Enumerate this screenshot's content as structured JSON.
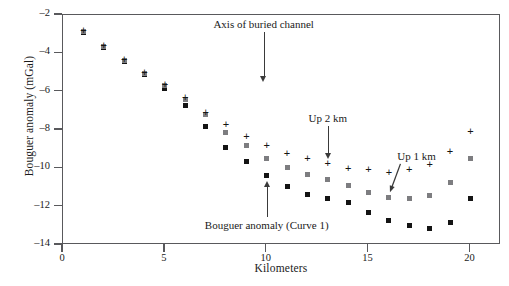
{
  "chart_data": {
    "type": "scatter",
    "title": "",
    "xlabel": "Kilometers",
    "ylabel": "Bouguer anomaly (mGal)",
    "xlim": [
      0,
      21.5
    ],
    "ylim": [
      -14,
      -2
    ],
    "xticks": [
      0,
      5,
      10,
      15,
      20
    ],
    "yticks": [
      -2,
      -4,
      -6,
      -8,
      -10,
      -12,
      -14
    ],
    "xtick_labels": [
      "0",
      "5",
      "10",
      "15",
      "20"
    ],
    "ytick_labels": [
      "-2",
      "-4",
      "-6",
      "-8",
      "-10",
      "-12",
      "-14"
    ],
    "grid": false,
    "legend": "none (inline annotations)",
    "x": [
      1,
      2,
      3,
      4,
      5,
      6,
      7,
      8,
      9,
      10,
      11,
      12,
      13,
      14,
      15,
      16,
      17,
      18,
      19,
      20
    ],
    "series": [
      {
        "name": "Bouguer anomaly (Curve 1)",
        "marker": "filled-square",
        "color": "#141414",
        "values": [
          -2.9,
          -3.7,
          -4.4,
          -5.1,
          -5.85,
          -6.7,
          -7.8,
          -8.9,
          -9.65,
          -10.35,
          -10.95,
          -11.35,
          -11.55,
          -11.8,
          -12.3,
          -12.7,
          -13.0,
          -13.15,
          -12.8,
          -11.55
        ]
      },
      {
        "name": "Up 1 km",
        "marker": "filled-square",
        "color": "#7d7d80",
        "values": [
          -2.85,
          -3.65,
          -4.35,
          -5.05,
          -5.7,
          -6.4,
          -7.2,
          -8.15,
          -8.8,
          -9.5,
          -9.95,
          -10.3,
          -10.6,
          -10.9,
          -11.25,
          -11.5,
          -11.55,
          -11.4,
          -10.75,
          -9.5
        ]
      },
      {
        "name": "Up 2 km",
        "marker": "plus",
        "color": "#141414",
        "values": [
          -2.8,
          -3.6,
          -4.3,
          -5.0,
          -5.6,
          -6.3,
          -7.1,
          -7.7,
          -8.35,
          -8.8,
          -9.2,
          -9.5,
          -9.75,
          -10.0,
          -10.05,
          -10.2,
          -10.05,
          -9.8,
          -9.1,
          -8.1
        ]
      }
    ],
    "annotations": [
      {
        "name": "axis-of-buried-channel",
        "text": "Axis of buried channel",
        "label_x_km": 9.85,
        "label_y_mgal": -2.45,
        "arrow_direction": "down",
        "arrow_tip_x_km": 9.85,
        "arrow_tip_y_mgal": -5.45
      },
      {
        "name": "up-2-km",
        "text": "Up 2 km",
        "label_x_km": 13.0,
        "label_y_mgal": -7.35,
        "arrow_direction": "down",
        "arrow_tip_x_km": 13.0,
        "arrow_tip_y_mgal": -9.45
      },
      {
        "name": "up-1-km",
        "text": "Up 1 km",
        "label_x_km": 17.35,
        "label_y_mgal": -9.35,
        "arrow_direction": "diagonal",
        "arrow_tip_x_km": 16.05,
        "arrow_tip_y_mgal": -11.25
      },
      {
        "name": "bouguer-anomaly-curve-1",
        "text": "Bouguer anomaly (Curve 1)",
        "label_x_km": 10.0,
        "label_y_mgal": -12.95,
        "arrow_direction": "up",
        "arrow_tip_x_km": 10.0,
        "arrow_tip_y_mgal": -10.7
      }
    ]
  }
}
